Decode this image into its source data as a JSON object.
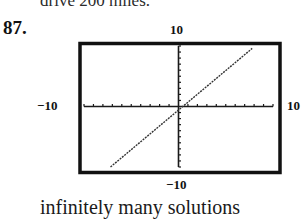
{
  "page": {
    "cutoff_text": "drive 200 miles.",
    "problem_number": "87.",
    "caption": "infinitely many solutions"
  },
  "window": {
    "xmin": "−10",
    "xmax": "10",
    "ymin": "−10",
    "ymax": "10"
  },
  "chart_data": {
    "type": "line",
    "title": "",
    "xlabel": "",
    "ylabel": "",
    "xlim": [
      -10,
      10
    ],
    "ylim": [
      -10,
      10
    ],
    "x_ticks_each_side": 10,
    "y_ticks_each_side": 10,
    "grid": false,
    "legend": null,
    "window_labels": {
      "top": "10",
      "bottom": "−10",
      "left": "−10",
      "right": "10"
    },
    "series": [
      {
        "name": "graph",
        "style": "dotted",
        "x": [
          -7.2,
          7.8
        ],
        "y": [
          -10,
          9.6
        ]
      }
    ],
    "annotation": "infinitely many solutions"
  },
  "colors": {
    "frame": "#111111",
    "axes": "#1a1a1a",
    "line": "#333333",
    "background": "#ffffff"
  }
}
